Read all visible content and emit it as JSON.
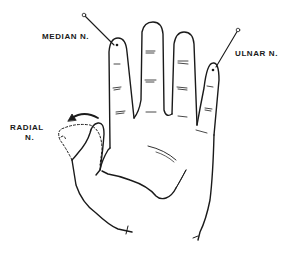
{
  "diagram": {
    "labels": {
      "median": "MEDIAN N.",
      "ulnar": "ULNAR N.",
      "radial_line1": "RADIAL",
      "radial_line2": "N."
    },
    "colors": {
      "line": "#1a1a1a",
      "background": "#ffffff"
    }
  }
}
